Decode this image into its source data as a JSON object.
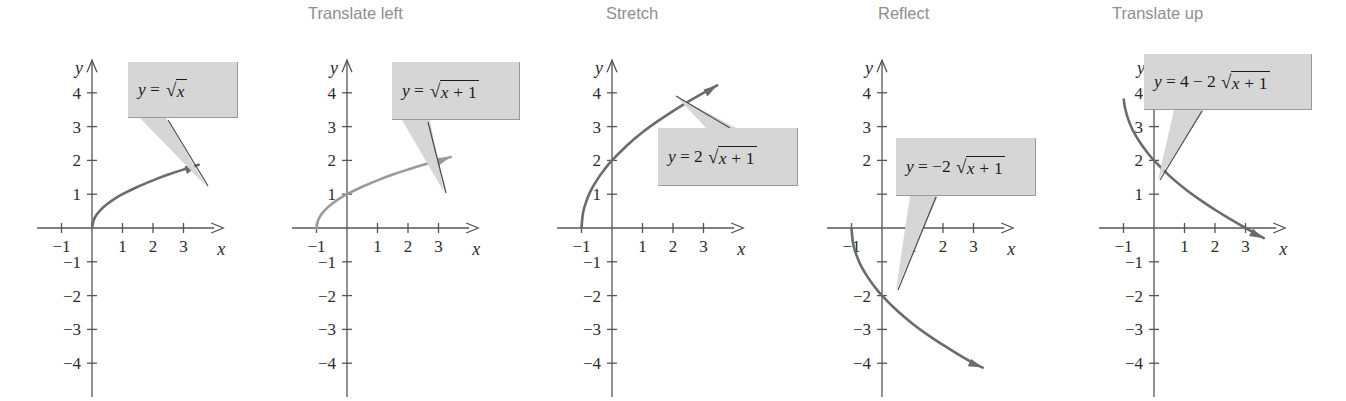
{
  "figure": {
    "width": 1346,
    "height": 401,
    "background": "#ffffff",
    "curve_color": "#6b6b6b",
    "axis_color": "#555555",
    "callout_fill": "#d6d6d6",
    "title_color": "#8e8e8e",
    "text_color": "#1c1c1c"
  },
  "chart_data": {
    "type": "line",
    "xlabel": "x",
    "ylabel": "y",
    "xlim": [
      -1.8,
      4.3
    ],
    "ylim": [
      -5.0,
      5.2
    ],
    "grid": false,
    "legend": "none",
    "x_ticks": [
      -1,
      1,
      2,
      3
    ],
    "y_ticks": [
      -4,
      -3,
      -2,
      -1,
      1,
      2,
      3,
      4
    ],
    "panels": [
      {
        "id": "panel-base",
        "title": "",
        "equation_text": "y = √x",
        "equation": {
          "lhs": "y",
          "eq": "=",
          "coef": "",
          "radicand": "x"
        },
        "function": "sqrt(x)",
        "series": [
          {
            "name": "y = √x",
            "color": "#6b6b6b",
            "domain": [
              0,
              3.5
            ],
            "points": [
              [
                0,
                0
              ],
              [
                0.05,
                0.22
              ],
              [
                0.15,
                0.39
              ],
              [
                0.3,
                0.55
              ],
              [
                0.5,
                0.71
              ],
              [
                0.75,
                0.87
              ],
              [
                1,
                1
              ],
              [
                1.5,
                1.22
              ],
              [
                2,
                1.41
              ],
              [
                2.5,
                1.58
              ],
              [
                3,
                1.73
              ],
              [
                3.5,
                1.87
              ]
            ],
            "arrow_end": true
          }
        ],
        "x_tick_labels": [
          "-1",
          "1",
          "2",
          "3"
        ],
        "y_tick_labels": [
          "4",
          "3",
          "2",
          "1",
          "-1",
          "-2",
          "-3",
          "-4"
        ],
        "shown_y_labels": [
          4,
          3,
          2,
          1,
          -1,
          -2,
          -3,
          -4
        ]
      },
      {
        "id": "panel-translate-left",
        "title": "Translate left",
        "equation_text": "y = √(x + 1)",
        "equation": {
          "lhs": "y",
          "eq": "=",
          "coef": "",
          "radicand": "x + 1"
        },
        "function": "sqrt(x+1)",
        "series": [
          {
            "name": "y = √(x + 1)",
            "color": "#9a9a9a",
            "domain": [
              -1,
              3.4
            ],
            "points": [
              [
                -1,
                0
              ],
              [
                -0.95,
                0.22
              ],
              [
                -0.85,
                0.39
              ],
              [
                -0.7,
                0.55
              ],
              [
                -0.5,
                0.71
              ],
              [
                -0.25,
                0.87
              ],
              [
                0,
                1
              ],
              [
                0.5,
                1.22
              ],
              [
                1,
                1.41
              ],
              [
                1.5,
                1.58
              ],
              [
                2,
                1.73
              ],
              [
                2.5,
                1.87
              ],
              [
                3,
                2.0
              ],
              [
                3.4,
                2.1
              ]
            ],
            "arrow_end": true
          }
        ],
        "x_tick_labels": [
          "-1",
          "1",
          "2",
          "3"
        ],
        "y_tick_labels": [
          "4",
          "3",
          "2",
          "1",
          "-1",
          "-2",
          "-3",
          "-4"
        ],
        "shown_y_labels": [
          4,
          3,
          2,
          1,
          -1,
          -2,
          -3,
          -4
        ]
      },
      {
        "id": "panel-stretch",
        "title": "Stretch",
        "equation_text": "y = 2 √(x + 1)",
        "equation": {
          "lhs": "y",
          "eq": "=",
          "coef": "2",
          "radicand": "x + 1"
        },
        "function": "2*sqrt(x+1)",
        "series": [
          {
            "name": "y = 2√(x + 1)",
            "color": "#6b6b6b",
            "domain": [
              -1,
              3.45
            ],
            "points": [
              [
                -1,
                0
              ],
              [
                -0.95,
                0.45
              ],
              [
                -0.85,
                0.77
              ],
              [
                -0.7,
                1.1
              ],
              [
                -0.5,
                1.41
              ],
              [
                -0.25,
                1.73
              ],
              [
                0,
                2
              ],
              [
                0.5,
                2.45
              ],
              [
                1,
                2.83
              ],
              [
                1.5,
                3.16
              ],
              [
                2,
                3.46
              ],
              [
                2.5,
                3.74
              ],
              [
                3,
                4.0
              ],
              [
                3.45,
                4.22
              ]
            ],
            "arrow_end": true
          }
        ],
        "x_tick_labels": [
          "-1",
          "1",
          "2",
          "3"
        ],
        "y_tick_labels": [
          "4",
          "3",
          "2",
          "1",
          "-1",
          "-2",
          "-3",
          "-4"
        ],
        "shown_y_labels": [
          4,
          3,
          2,
          1,
          -1,
          -2,
          -3,
          -4
        ]
      },
      {
        "id": "panel-reflect",
        "title": "Reflect",
        "equation_text": "y = −2 √(x + 1)",
        "equation": {
          "lhs": "y",
          "eq": "=",
          "coef": "−2",
          "radicand": "x + 1"
        },
        "function": "-2*sqrt(x+1)",
        "series": [
          {
            "name": "y = −2√(x + 1)",
            "color": "#6b6b6b",
            "domain": [
              -1,
              3.3
            ],
            "points": [
              [
                -1,
                0
              ],
              [
                -0.95,
                -0.45
              ],
              [
                -0.85,
                -0.77
              ],
              [
                -0.7,
                -1.1
              ],
              [
                -0.5,
                -1.41
              ],
              [
                -0.25,
                -1.73
              ],
              [
                0,
                -2
              ],
              [
                0.5,
                -2.45
              ],
              [
                1,
                -2.83
              ],
              [
                1.5,
                -3.16
              ],
              [
                2,
                -3.46
              ],
              [
                2.5,
                -3.74
              ],
              [
                3,
                -4.0
              ],
              [
                3.3,
                -4.13
              ]
            ],
            "arrow_end": true
          }
        ],
        "x_tick_labels": [
          "-1",
          "1",
          "2",
          "3"
        ],
        "y_tick_labels": [
          "4",
          "3",
          "2",
          "1",
          "",
          "-2",
          "-3",
          "-4"
        ],
        "shown_y_labels": [
          4,
          3,
          2,
          -2,
          -3,
          -4
        ]
      },
      {
        "id": "panel-translate-up",
        "title": "Translate up",
        "equation_text": "y = 4 − 2 √(x + 1)",
        "equation": {
          "lhs": "y",
          "eq": "=",
          "const": "4",
          "op": "−",
          "coef": "2",
          "radicand": "x + 1"
        },
        "function": "4-2*sqrt(x+1)",
        "series": [
          {
            "name": "y = 4 − 2√(x + 1)",
            "color": "#6b6b6b",
            "domain": [
              -0.99,
              3.6
            ],
            "points": [
              [
                -0.99,
                3.8
              ],
              [
                -0.95,
                3.55
              ],
              [
                -0.85,
                3.23
              ],
              [
                -0.7,
                2.9
              ],
              [
                -0.5,
                2.59
              ],
              [
                -0.25,
                2.27
              ],
              [
                0,
                2
              ],
              [
                0.5,
                1.55
              ],
              [
                1,
                1.17
              ],
              [
                1.5,
                0.84
              ],
              [
                2,
                0.54
              ],
              [
                2.5,
                0.26
              ],
              [
                3,
                0.0
              ],
              [
                3.6,
                -0.3
              ]
            ],
            "arrow_end": true
          }
        ],
        "x_tick_labels": [
          "-1",
          "1",
          "2",
          "3"
        ],
        "y_tick_labels": [
          "4",
          "3",
          "2",
          "1",
          "-1",
          "-2",
          "-3",
          "-4"
        ],
        "shown_y_labels": [
          4,
          3,
          2,
          1,
          -1,
          -2,
          -3,
          -4
        ]
      }
    ]
  }
}
